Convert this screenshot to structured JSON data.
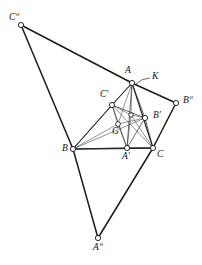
{
  "figure": {
    "background_color": "#ffffff",
    "line_color": "#1a1a1a",
    "vertex_fill": "#ffffff",
    "width": 202,
    "height": 265
  },
  "points": [
    {
      "id": "C2",
      "label": "Cʺ",
      "x": 21,
      "y": 25,
      "lx": 9,
      "ly": 13,
      "r": 2.6,
      "size": "lbl"
    },
    {
      "id": "A",
      "label": "A",
      "x": 132,
      "y": 83,
      "lx": 125,
      "ly": 66,
      "r": 2.6,
      "size": "lbl"
    },
    {
      "id": "K",
      "label": "K",
      "x": 0,
      "y": 0,
      "lx": 152,
      "ly": 72,
      "r": 0,
      "size": "lbl"
    },
    {
      "id": "B2",
      "label": "Bʺ",
      "x": 176,
      "y": 103,
      "lx": 183,
      "ly": 96,
      "r": 2.6,
      "size": "lbl"
    },
    {
      "id": "Cp",
      "label": "C′",
      "x": 112,
      "y": 105,
      "lx": 100,
      "ly": 90,
      "r": 2.6,
      "size": "lbl"
    },
    {
      "id": "Bp",
      "label": "B′",
      "x": 145,
      "y": 118,
      "lx": 153,
      "ly": 111,
      "r": 2.6,
      "size": "lbl"
    },
    {
      "id": "G",
      "label": "G",
      "x": 118,
      "y": 124,
      "lx": 112,
      "ly": 127,
      "r": 2.4,
      "size": "lbl"
    },
    {
      "id": "O",
      "label": "",
      "x": 131,
      "y": 115,
      "lx": 0,
      "ly": 0,
      "r": 2.2,
      "size": "lbl"
    },
    {
      "id": "B",
      "label": "B",
      "x": 73,
      "y": 149,
      "lx": 62,
      "ly": 144,
      "r": 2.6,
      "size": "lbl"
    },
    {
      "id": "Ap",
      "label": "A′",
      "x": 127,
      "y": 148,
      "lx": 122,
      "ly": 152,
      "r": 2.6,
      "size": "lbl"
    },
    {
      "id": "C",
      "label": "C",
      "x": 153,
      "y": 148,
      "lx": 157,
      "ly": 150,
      "r": 2.6,
      "size": "lbl"
    },
    {
      "id": "A2",
      "label": "Aʺ",
      "x": 98,
      "y": 238,
      "lx": 93,
      "ly": 243,
      "r": 2.6,
      "size": "lbl"
    }
  ],
  "segments": [
    {
      "from": "C2",
      "to": "A",
      "weight": "thick",
      "name": "outer-edge-c2-a"
    },
    {
      "from": "A",
      "to": "B2",
      "weight": "thick",
      "name": "outer-edge-a-b2"
    },
    {
      "from": "B2",
      "to": "C",
      "weight": "thick",
      "name": "outer-edge-b2-c"
    },
    {
      "from": "C2",
      "to": "B",
      "weight": "thick",
      "name": "outer-edge-c2-b"
    },
    {
      "from": "B",
      "to": "A2",
      "weight": "thick",
      "name": "outer-edge-b-a2"
    },
    {
      "from": "A2",
      "to": "C",
      "weight": "thick",
      "name": "outer-edge-a2-c"
    },
    {
      "from": "B",
      "to": "C",
      "weight": "thick",
      "name": "triangle-edge-b-c"
    },
    {
      "from": "B",
      "to": "Cp",
      "weight": "med",
      "name": "triangle-edge-b-cp"
    },
    {
      "from": "Cp",
      "to": "A",
      "weight": "med",
      "name": "triangle-edge-cp-a"
    },
    {
      "from": "A",
      "to": "C",
      "weight": "med",
      "name": "triangle-edge-a-c"
    },
    {
      "from": "Cp",
      "to": "Ap",
      "weight": "thin",
      "name": "inner-edge-cp-ap"
    },
    {
      "from": "Ap",
      "to": "Bp",
      "weight": "thin",
      "name": "inner-edge-ap-bp"
    },
    {
      "from": "Bp",
      "to": "Cp",
      "weight": "thin",
      "name": "inner-edge-bp-cp"
    },
    {
      "from": "A",
      "to": "Ap",
      "weight": "thin",
      "name": "cevian-a-ap"
    },
    {
      "from": "A",
      "to": "Bp",
      "weight": "thin",
      "name": "cevian-a-bp"
    },
    {
      "from": "A",
      "to": "G",
      "weight": "hair",
      "name": "cevian-a-g"
    },
    {
      "from": "A",
      "to": "O",
      "weight": "hair",
      "name": "cevian-a-o"
    },
    {
      "from": "B",
      "to": "G",
      "weight": "hair",
      "name": "cevian-b-g"
    },
    {
      "from": "B",
      "to": "Bp",
      "weight": "hair",
      "name": "cevian-b-bp"
    },
    {
      "from": "G",
      "to": "Ap",
      "weight": "hair",
      "name": "cevian-g-ap"
    },
    {
      "from": "G",
      "to": "Bp",
      "weight": "hair",
      "name": "cevian-g-bp"
    },
    {
      "from": "G",
      "to": "Cp",
      "weight": "hair",
      "name": "cevian-g-cp"
    },
    {
      "from": "O",
      "to": "Ap",
      "weight": "hair",
      "name": "cevian-o-ap"
    },
    {
      "from": "O",
      "to": "Bp",
      "weight": "hair",
      "name": "cevian-o-bp"
    },
    {
      "from": "O",
      "to": "Cp",
      "weight": "hair",
      "name": "cevian-o-cp"
    },
    {
      "from": "O",
      "to": "C",
      "weight": "hair",
      "name": "cevian-o-c"
    },
    {
      "from": "Cp",
      "to": "C",
      "weight": "hair",
      "name": "cevian-cp-c"
    },
    {
      "from": "Bp",
      "to": "C",
      "weight": "thin",
      "name": "cevian-bp-c"
    },
    {
      "from": "Ap",
      "to": "C",
      "weight": "thin",
      "name": "edge-ap-c"
    },
    {
      "from": "Cp",
      "to": "B",
      "weight": "hair",
      "name": "edge-cp-b-thin"
    },
    {
      "from": "B",
      "to": "Ap",
      "weight": "hair",
      "name": "edge-b-ap"
    }
  ],
  "annotations": {
    "k_pointer": {
      "name": "k-leader-arc",
      "path": "M 150 78 Q 142 78 136 84",
      "label": "K"
    }
  }
}
